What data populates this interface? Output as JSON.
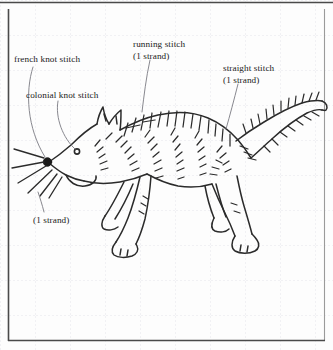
{
  "figure": {
    "kind": "embroidery-pattern-diagram",
    "background": "graph paper with faint dotted grid",
    "ink_color": "#2b2b2b",
    "grid_color": "#e3e3ea",
    "frame_color": "#4a4a4a",
    "paper_color": "#fdfdfd"
  },
  "labels": {
    "french_knot": {
      "text": "french knot stitch"
    },
    "colonial_knot": {
      "text": "colonial knot stitch"
    },
    "running_stitch": {
      "text": "running stitch",
      "strand": "(1 strand)"
    },
    "straight_stitch": {
      "text": "straight stitch",
      "strand": "(1 strand)"
    },
    "whisker_strand": {
      "text": "(1 strand)"
    }
  }
}
